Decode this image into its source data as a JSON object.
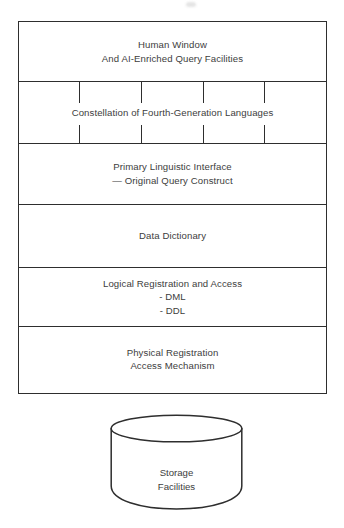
{
  "figure": {
    "stroke_color": "#2e2e2e",
    "text_color": "#3d3d3d",
    "background_color": "#ffffff",
    "layers": [
      {
        "id": "human-window",
        "label": "Human Window\nAnd AI-Enriched Query Facilities",
        "divider_top": false,
        "has_ticks": false
      },
      {
        "id": "constellation",
        "label": "Constellation of Fourth-Generation Languages",
        "divider_top": true,
        "has_ticks": true,
        "tick_positions": [
          60,
          122,
          184,
          245
        ]
      },
      {
        "id": "primary-linguistic-interface",
        "label": "Primary Linguistic Interface\n— Original Query Construct",
        "divider_top": true,
        "has_ticks": false
      },
      {
        "id": "data-dictionary",
        "label": "Data Dictionary",
        "divider_top": true,
        "has_ticks": false
      },
      {
        "id": "logical-registration-and-access",
        "label": "Logical Registration and Access\n- DML\n- DDL",
        "divider_top": true,
        "has_ticks": false
      },
      {
        "id": "physical-registration",
        "label": "Physical Registration\nAccess Mechanism",
        "divider_top": true,
        "has_ticks": false
      }
    ],
    "storage": {
      "shape": "database-cylinder",
      "label": "Storage\nFacilities"
    }
  }
}
